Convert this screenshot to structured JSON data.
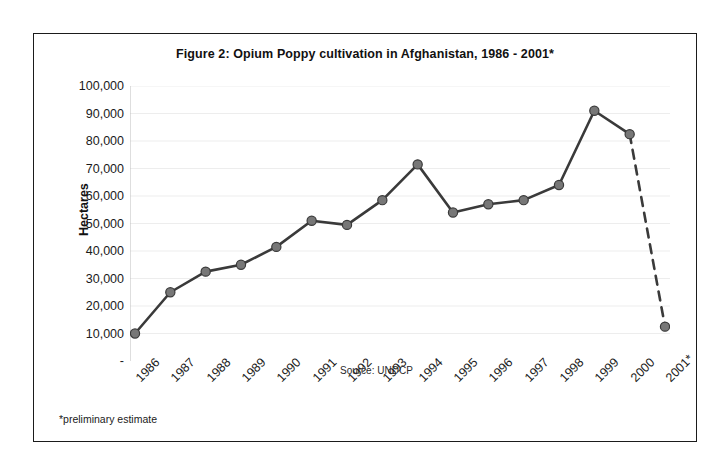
{
  "figure": {
    "title": "Figure 2: Opium Poppy cultivation in Afghanistan, 1986 - 2001*",
    "source_note": "Source: UNDCP",
    "footnote": "*preliminary estimate",
    "frame_color": "#1b1b1b",
    "background_color": "#ffffff"
  },
  "chart_data": {
    "type": "line",
    "title": "Figure 2: Opium Poppy cultivation in Afghanistan, 1986 - 2001*",
    "xlabel": "",
    "ylabel": "Hectares",
    "categories": [
      "1986",
      "1987",
      "1988",
      "1989",
      "1990",
      "1991",
      "1992",
      "1993",
      "1994",
      "1995",
      "1996",
      "1997",
      "1998",
      "1999",
      "2000",
      "2001*"
    ],
    "values": [
      10000,
      25000,
      32500,
      35000,
      41500,
      51000,
      49500,
      58500,
      71500,
      54000,
      57000,
      58500,
      64000,
      91000,
      82500,
      12500
    ],
    "ylim": [
      0,
      100000
    ],
    "ytick_labels": [
      "100,000",
      "90,000",
      "80,000",
      "70,000",
      "60,000",
      "50,000",
      "40,000",
      "30,000",
      "20,000",
      "10,000",
      "-"
    ],
    "ytick_values": [
      100000,
      90000,
      80000,
      70000,
      60000,
      50000,
      40000,
      30000,
      20000,
      10000,
      0
    ],
    "grid": true,
    "legend": "none",
    "series_color": "#3a3a3a",
    "marker_color": "#777777",
    "marker_edge_color": "#3a3a3a",
    "dashed_from_index": 14,
    "dashed_note": "segment from 2000 to 2001* is dashed (preliminary estimate)",
    "annotations": [
      "Source: UNDCP",
      "*preliminary estimate"
    ]
  }
}
